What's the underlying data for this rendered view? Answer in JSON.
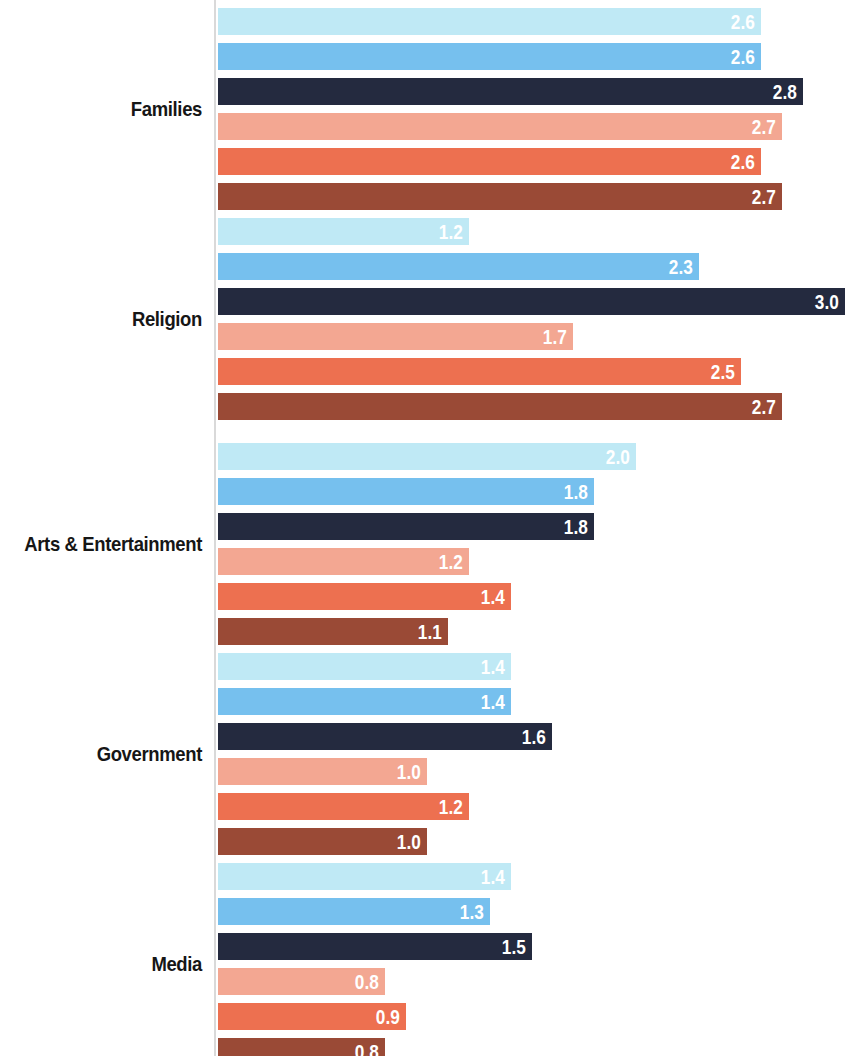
{
  "chart_data": {
    "type": "bar",
    "orientation": "horizontal",
    "title": "",
    "subtitle": "",
    "xlabel": "",
    "ylabel": "",
    "xlim": [
      0,
      3.05
    ],
    "grid": false,
    "legend_position": "none",
    "value_labels": true,
    "value_label_format": "one-decimal",
    "categories": [
      "Families",
      "Religion",
      "Arts & Entertainment",
      "Government",
      "Media"
    ],
    "series": [
      {
        "name": "series-1",
        "color": "#bfe9f5",
        "values": [
          2.6,
          1.2,
          2.0,
          1.4,
          1.4
        ]
      },
      {
        "name": "series-2",
        "color": "#76c0ee",
        "values": [
          2.6,
          2.3,
          1.8,
          1.4,
          1.3
        ]
      },
      {
        "name": "series-3",
        "color": "#242a3f",
        "values": [
          2.8,
          3.0,
          1.8,
          1.6,
          1.5
        ]
      },
      {
        "name": "series-4",
        "color": "#f2a device",
        "values": [
          2.7,
          1.7,
          1.2,
          1.0,
          0.8
        ]
      },
      {
        "name": "series-5",
        "color": "#ed7050",
        "values": [
          2.6,
          2.5,
          1.4,
          1.2,
          0.9
        ]
      },
      {
        "name": "series-6",
        "color": "#9a4a36",
        "values": [
          2.7,
          2.7,
          1.1,
          1.0,
          0.8
        ]
      }
    ]
  },
  "groups": [
    {
      "label": "Families",
      "bars": [
        {
          "value": 2.6,
          "label": "2.6",
          "color": "#bfe9f5"
        },
        {
          "value": 2.6,
          "label": "2.6",
          "color": "#76c0ee"
        },
        {
          "value": 2.8,
          "label": "2.8",
          "color": "#242a3f"
        },
        {
          "value": 2.7,
          "label": "2.7",
          "color": "#f3a792"
        },
        {
          "value": 2.6,
          "label": "2.6",
          "color": "#ed7050"
        },
        {
          "value": 2.7,
          "label": "2.7",
          "color": "#9a4a36"
        }
      ]
    },
    {
      "label": "Religion",
      "bars": [
        {
          "value": 1.2,
          "label": "1.2",
          "color": "#bfe9f5"
        },
        {
          "value": 2.3,
          "label": "2.3",
          "color": "#76c0ee"
        },
        {
          "value": 3.0,
          "label": "3.0",
          "color": "#242a3f"
        },
        {
          "value": 1.7,
          "label": "1.7",
          "color": "#f3a792"
        },
        {
          "value": 2.5,
          "label": "2.5",
          "color": "#ed7050"
        },
        {
          "value": 2.7,
          "label": "2.7",
          "color": "#9a4a36"
        }
      ]
    },
    {
      "label": "Arts & Entertainment",
      "bars": [
        {
          "value": 2.0,
          "label": "2.0",
          "color": "#bfe9f5"
        },
        {
          "value": 1.8,
          "label": "1.8",
          "color": "#76c0ee"
        },
        {
          "value": 1.8,
          "label": "1.8",
          "color": "#242a3f"
        },
        {
          "value": 1.2,
          "label": "1.2",
          "color": "#f3a792"
        },
        {
          "value": 1.4,
          "label": "1.4",
          "color": "#ed7050"
        },
        {
          "value": 1.1,
          "label": "1.1",
          "color": "#9a4a36"
        }
      ]
    },
    {
      "label": "Government",
      "bars": [
        {
          "value": 1.4,
          "label": "1.4",
          "color": "#bfe9f5"
        },
        {
          "value": 1.4,
          "label": "1.4",
          "color": "#76c0ee"
        },
        {
          "value": 1.6,
          "label": "1.6",
          "color": "#242a3f"
        },
        {
          "value": 1.0,
          "label": "1.0",
          "color": "#f3a792"
        },
        {
          "value": 1.2,
          "label": "1.2",
          "color": "#ed7050"
        },
        {
          "value": 1.0,
          "label": "1.0",
          "color": "#9a4a36"
        }
      ]
    },
    {
      "label": "Media",
      "bars": [
        {
          "value": 1.4,
          "label": "1.4",
          "color": "#bfe9f5"
        },
        {
          "value": 1.3,
          "label": "1.3",
          "color": "#76c0ee"
        },
        {
          "value": 1.5,
          "label": "1.5",
          "color": "#242a3f"
        },
        {
          "value": 0.8,
          "label": "0.8",
          "color": "#f3a792"
        },
        {
          "value": 0.9,
          "label": "0.9",
          "color": "#ed7050"
        },
        {
          "value": 0.8,
          "label": "0.8",
          "color": "#9a4a36"
        }
      ]
    }
  ],
  "layout": {
    "axis_x": 214,
    "bar_origin_x": 218,
    "px_per_unit": 209,
    "bar_height": 27,
    "bar_gap": 8,
    "group_top_offsets": [
      8,
      218,
      443,
      653,
      863
    ],
    "axis_color": "#d9d9d9"
  }
}
